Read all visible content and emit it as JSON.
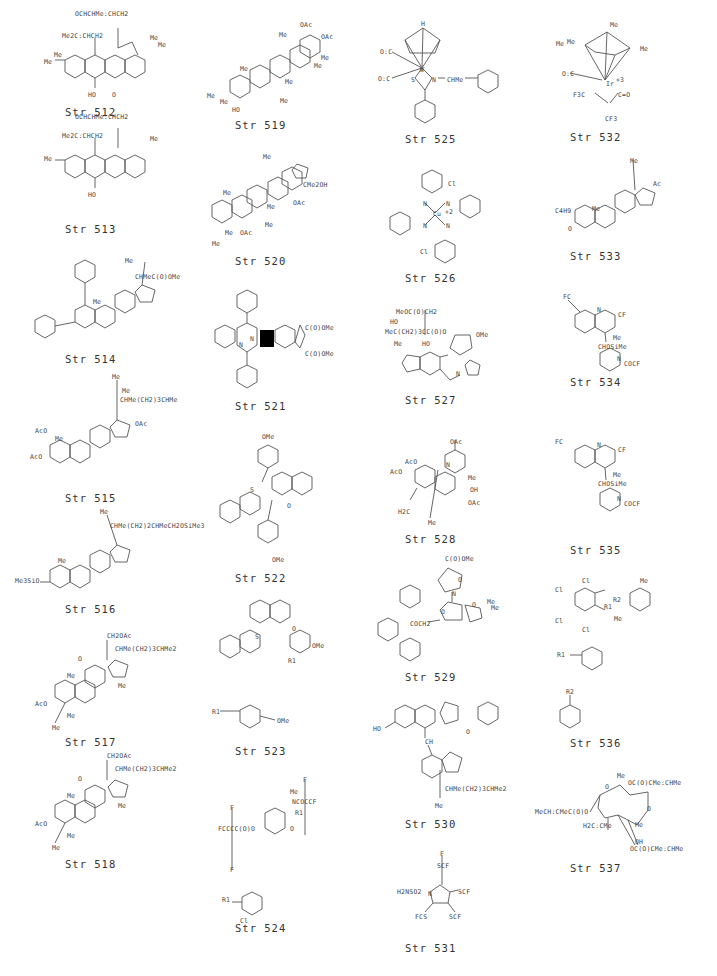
{
  "page": {
    "background": "#ffffff",
    "line_color": "#555555"
  },
  "structures": [
    {
      "id": "512",
      "caption": "Str  512",
      "labels": [
        "OCHCHMe:CHCH2",
        "Me2C:CHCH2",
        "Me",
        "Me",
        "Me",
        "Me",
        "O",
        "O",
        "O",
        "O",
        "HO",
        "O"
      ]
    },
    {
      "id": "513",
      "caption": "Str  513",
      "labels": [
        "OCHCHMe:CHCH2",
        "Me2C:CHCH2",
        "Me",
        "Me",
        "Me",
        "Me",
        "O",
        "O",
        "O",
        "O",
        "HO",
        "O"
      ]
    },
    {
      "id": "514",
      "caption": "Str  514",
      "labels": [
        "Me",
        "CHMeC(O)OMe",
        "Me",
        "O",
        "O",
        "O",
        "O"
      ]
    },
    {
      "id": "515",
      "caption": "Str  515",
      "labels": [
        "Me",
        "Me",
        "CHMe(CH2)3CHMe",
        "AcO",
        "Me",
        "OAc",
        "AcO"
      ]
    },
    {
      "id": "516",
      "caption": "Str  516",
      "labels": [
        "Me",
        "CHMe(CH2)2CHMeCH2OSiMe3",
        "Me",
        "Me3SiO"
      ]
    },
    {
      "id": "517",
      "caption": "Str  517",
      "labels": [
        "CH2OAc",
        "CHMe(CH2)3CHMe2",
        "O",
        "Me",
        "Me",
        "AcO",
        "Me",
        "Me"
      ]
    },
    {
      "id": "518",
      "caption": "Str  518",
      "labels": [
        "CH2OAc",
        "CHMe(CH2)3CHMe2",
        "O",
        "Me",
        "Me",
        "AcO",
        "Me",
        "Me"
      ]
    },
    {
      "id": "519",
      "caption": "Str  519",
      "labels": [
        "OAc",
        "Me",
        "OAc",
        "Me",
        "Me",
        "Me",
        "Me",
        "Me",
        "Me",
        "Me",
        "HO"
      ]
    },
    {
      "id": "520",
      "caption": "Str  520",
      "labels": [
        "Me",
        "CMe2OH",
        "Me",
        "OAc",
        "Me",
        "Me",
        "Me",
        "OAc",
        "Me"
      ]
    },
    {
      "id": "521",
      "caption": "Str  521",
      "labels": [
        "N",
        "N",
        "C(O)OMe",
        "C(O)OMe"
      ]
    },
    {
      "id": "522",
      "caption": "Str  522",
      "labels": [
        "OMe",
        "S",
        "O",
        "OMe"
      ]
    },
    {
      "id": "523",
      "caption": "Str  523",
      "labels": [
        "O",
        "S",
        "R1",
        "OMe",
        "R1",
        "OMe"
      ]
    },
    {
      "id": "524",
      "caption": "Str  524",
      "labels": [
        "F",
        "Me",
        "NCOCCF",
        "F",
        "F",
        "F",
        "R1",
        "F",
        "F",
        "FCCCC(O)O",
        "O",
        "F",
        "F",
        "R1",
        "Cl"
      ]
    },
    {
      "id": "525",
      "caption": "Str  525",
      "labels": [
        "H",
        "O:C",
        "O:C",
        "W",
        "S",
        "N",
        "CHMe"
      ]
    },
    {
      "id": "526",
      "caption": "Str  526",
      "labels": [
        "Cl",
        "N",
        "N",
        "Cu",
        "+2",
        "N",
        "N",
        "Cl"
      ]
    },
    {
      "id": "527",
      "caption": "Str  527",
      "labels": [
        "MeOC(O)CH2",
        "HO",
        "MeC(CH2)3CC(O)O",
        "Me",
        "HO",
        "OMe",
        "O",
        "O",
        "N"
      ]
    },
    {
      "id": "528",
      "caption": "Str  528",
      "labels": [
        "OAc",
        "AcO",
        "AcO",
        "N",
        "Me",
        "OH",
        "OAc",
        "H2C",
        "Me"
      ]
    },
    {
      "id": "529",
      "caption": "Str  529",
      "labels": [
        "C(O)OMe",
        "O",
        "N",
        "O",
        "O",
        "Me",
        "Me",
        "COCH2",
        "O"
      ]
    },
    {
      "id": "530",
      "caption": "Str  530",
      "labels": [
        "N",
        "N",
        "N",
        "HO",
        "O",
        "CH",
        "CHMe(CH2)3CHMe2",
        "Me"
      ]
    },
    {
      "id": "531",
      "caption": "Str  531",
      "labels": [
        "F",
        "SCF",
        "F",
        "H2NSO2",
        "N",
        "F",
        "SCF",
        "F",
        "F",
        "FCS",
        "F",
        "F",
        "SCF",
        "F"
      ]
    },
    {
      "id": "532",
      "caption": "Str  532",
      "labels": [
        "Me",
        "Me",
        "Me",
        "Me",
        "O:C",
        "Ir",
        "+3",
        "F3C",
        "C",
        "C",
        "C=O",
        "CF3",
        "Me"
      ]
    },
    {
      "id": "533",
      "caption": "Str  533",
      "labels": [
        "Me",
        "Ac",
        "C4H9",
        "Me",
        "O"
      ]
    },
    {
      "id": "534",
      "caption": "Str  534",
      "labels": [
        "F",
        "FC",
        "F",
        "N",
        "F",
        "CF",
        "F",
        "Me",
        "CHOSiMe",
        "Me",
        "N",
        "COCF",
        "F",
        "F"
      ]
    },
    {
      "id": "535",
      "caption": "Str  535",
      "labels": [
        "F",
        "FC",
        "F",
        "N",
        "F",
        "CF",
        "F",
        "Me",
        "CHOSiMe",
        "Me",
        "N",
        "COCF",
        "F",
        "F"
      ]
    },
    {
      "id": "536",
      "caption": "Str  536",
      "labels": [
        "Cl",
        "Cl",
        "Cl",
        "Cl",
        "O",
        "R2",
        "R1",
        "O",
        "Me",
        "Me",
        "R1",
        "R2"
      ]
    },
    {
      "id": "537",
      "caption": "Str  537",
      "labels": [
        "Me",
        "OC(O)CMe:CHMe",
        "O",
        "MeCH:CMeC(O)O",
        "O",
        "Me",
        "H2C:CMe",
        "OH",
        "OC(O)CMe:CHMe"
      ]
    }
  ]
}
